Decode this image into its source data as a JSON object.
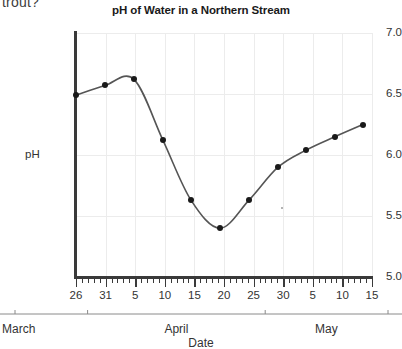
{
  "page": {
    "question_fragment": "trout?"
  },
  "chart_data": {
    "type": "line",
    "title": "pH of Water in a Northern Stream",
    "xlabel": "Date",
    "ylabel": "pH",
    "ylim": [
      5.0,
      7.0
    ],
    "y_ticks": [
      "7.0",
      "6.5",
      "6.0",
      "5.5",
      "5.0"
    ],
    "y_tick_values": [
      7.0,
      6.5,
      6.0,
      5.5,
      5.0
    ],
    "grid": true,
    "legend": "none",
    "x_tick_labels": [
      "26",
      "31",
      "5",
      "10",
      "15",
      "20",
      "25",
      "30",
      "5",
      "10",
      "15"
    ],
    "x_minor_tick_interval": 1,
    "month_groups": [
      {
        "label": "March",
        "start_tick": 0,
        "end_tick": 1
      },
      {
        "label": "April",
        "start_tick": 1,
        "end_tick": 7
      },
      {
        "label": "May",
        "start_tick": 7,
        "end_tick": 10
      }
    ],
    "x": [
      "Mar 26",
      "Mar 31",
      "Apr 5",
      "Apr 10",
      "Apr 15",
      "Apr 20",
      "Apr 25",
      "Apr 30",
      "May 5",
      "May 10",
      "May 15"
    ],
    "values": [
      6.49,
      6.57,
      6.62,
      6.12,
      5.63,
      5.4,
      5.63,
      5.9,
      6.04,
      6.15,
      6.25
    ],
    "points": [
      {
        "label": "Mar 26",
        "x_px": 76,
        "value": 6.49
      },
      {
        "label": "Mar 31",
        "x_px": 105,
        "value": 6.57
      },
      {
        "label": "Apr 5",
        "x_px": 134,
        "value": 6.62
      },
      {
        "label": "Apr 10",
        "x_px": 163,
        "value": 6.12
      },
      {
        "label": "Apr 15",
        "x_px": 191,
        "value": 5.63
      },
      {
        "label": "Apr 20",
        "x_px": 220,
        "value": 5.4
      },
      {
        "label": "Apr 25",
        "x_px": 249,
        "value": 5.63
      },
      {
        "label": "Apr 30",
        "x_px": 278,
        "value": 5.9
      },
      {
        "label": "May 5",
        "x_px": 306,
        "value": 6.04
      },
      {
        "label": "May 10",
        "x_px": 335,
        "value": 6.15
      },
      {
        "label": "May 15",
        "x_px": 363,
        "value": 6.25
      }
    ],
    "line_color": "#555555",
    "marker_color": "#1a1a1a"
  }
}
